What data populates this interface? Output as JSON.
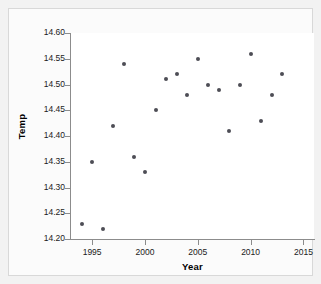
{
  "chart_data": {
    "type": "scatter",
    "title": "",
    "xlabel": "Year",
    "ylabel": "Temp",
    "xlim": [
      1993,
      2016
    ],
    "ylim": [
      14.2,
      14.6
    ],
    "grid": false,
    "legend": null,
    "x_ticks": [
      1995,
      2000,
      2005,
      2010,
      2015
    ],
    "x_tick_labels": [
      "1995",
      "2000",
      "2005",
      "2010",
      "2015"
    ],
    "y_ticks": [
      14.2,
      14.25,
      14.3,
      14.35,
      14.4,
      14.45,
      14.5,
      14.55,
      14.6
    ],
    "y_tick_labels": [
      "14.20",
      "14.25",
      "14.30",
      "14.35",
      "14.40",
      "14.45",
      "14.50",
      "14.55",
      "14.60"
    ],
    "marker_color": "#4d4d55",
    "axis_color": "#8c8c8c",
    "plot_background": "#ffffff",
    "figure_background": "#f2f2f2",
    "points": [
      {
        "x": 1994,
        "y": 14.23
      },
      {
        "x": 1995,
        "y": 14.35
      },
      {
        "x": 1996,
        "y": 14.22
      },
      {
        "x": 1997,
        "y": 14.42
      },
      {
        "x": 1998,
        "y": 14.54
      },
      {
        "x": 1999,
        "y": 14.36
      },
      {
        "x": 2000,
        "y": 14.33
      },
      {
        "x": 2001,
        "y": 14.45
      },
      {
        "x": 2002,
        "y": 14.51
      },
      {
        "x": 2003,
        "y": 14.52
      },
      {
        "x": 2004,
        "y": 14.48
      },
      {
        "x": 2005,
        "y": 14.55
      },
      {
        "x": 2006,
        "y": 14.5
      },
      {
        "x": 2007,
        "y": 14.49
      },
      {
        "x": 2008,
        "y": 14.41
      },
      {
        "x": 2009,
        "y": 14.5
      },
      {
        "x": 2010,
        "y": 14.56
      },
      {
        "x": 2011,
        "y": 14.43
      },
      {
        "x": 2012,
        "y": 14.48
      },
      {
        "x": 2013,
        "y": 14.52
      }
    ]
  }
}
